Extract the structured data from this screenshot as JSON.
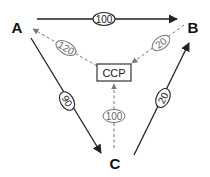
{
  "diagram": {
    "nodes": [
      {
        "id": "A",
        "label": "A"
      },
      {
        "id": "B",
        "label": "B"
      },
      {
        "id": "C",
        "label": "C"
      },
      {
        "id": "CCP",
        "label": "CCP"
      }
    ],
    "edges": [
      {
        "from": "A",
        "to": "B",
        "label": "100",
        "style": "solid"
      },
      {
        "from": "A",
        "to": "C",
        "label": "90",
        "style": "solid"
      },
      {
        "from": "C",
        "to": "B",
        "label": "20",
        "style": "solid"
      },
      {
        "from": "CCP",
        "to": "A",
        "label": "120",
        "style": "dashed"
      },
      {
        "from": "B",
        "to": "CCP",
        "label": "20",
        "style": "dashed"
      },
      {
        "from": "C",
        "to": "CCP",
        "label": "100",
        "style": "dashed"
      }
    ]
  },
  "colors": {
    "solid": "#222222",
    "dashed": "#777777",
    "background": "#ffffff"
  }
}
